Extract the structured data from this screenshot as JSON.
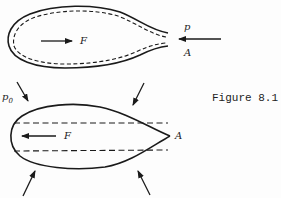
{
  "figure": {
    "caption": "Figure 8.1",
    "top_diagram": {
      "force_label": "F",
      "pressure_label": "p",
      "point_label": "A"
    },
    "bottom_diagram": {
      "force_label": "F",
      "point_label": "A",
      "ambient_pressure_label": "p",
      "ambient_pressure_subscript": "0"
    },
    "colors": {
      "stroke": "#1a1a1a",
      "background": "#fdfdfd"
    }
  }
}
